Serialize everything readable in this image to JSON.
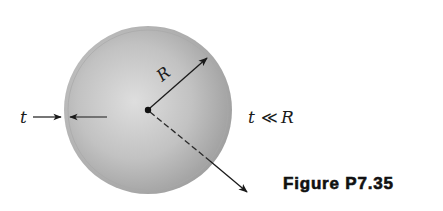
{
  "figure": {
    "caption": "Figure P7.35",
    "labels": {
      "radius": "R",
      "thickness": "t",
      "condition_t": "t",
      "condition_op": "≪",
      "condition_R": "R"
    },
    "shapes": {
      "sphere": {
        "center": [
          148,
          110
        ],
        "radius": 84,
        "fill_light": "#d9d9d9",
        "fill_dark": "#9a9a9a",
        "rim_color": "#8a8a8a"
      },
      "radius_arrow": {
        "from": [
          148,
          110
        ],
        "to": [
          207,
          58
        ]
      },
      "normal_arrow": {
        "from": [
          148,
          110
        ],
        "to": [
          248,
          193
        ],
        "style": "dashed-inside-solid-outside"
      },
      "thickness_arrows": {
        "left_from": [
          33,
          117
        ],
        "left_to": [
          62,
          117
        ],
        "right_from": [
          108,
          117
        ],
        "right_to": [
          69,
          117
        ]
      },
      "center_dot": [
        148,
        110
      ]
    },
    "colors": {
      "ink": "#1a1a1a",
      "background": "#ffffff"
    }
  }
}
